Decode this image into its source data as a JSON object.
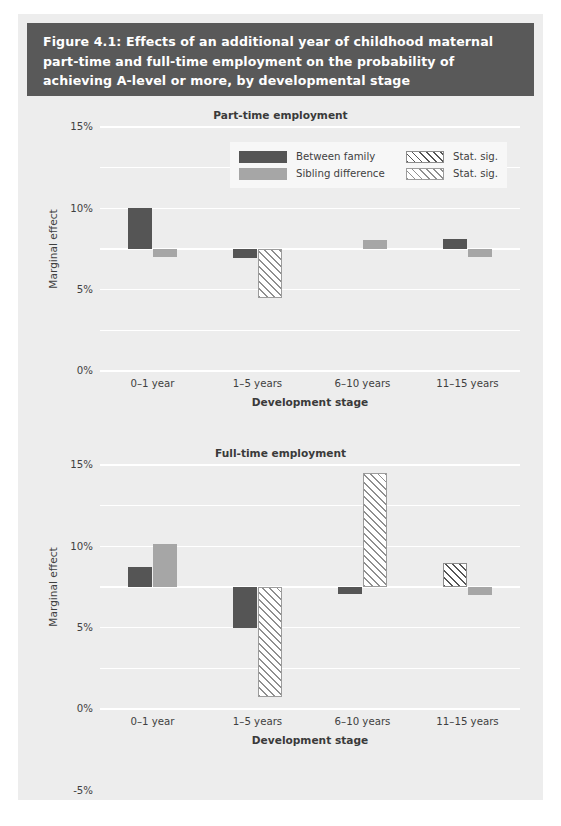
{
  "figure": {
    "title": "Figure 4.1: Effects of an additional year of childhood maternal part-time and full-time employment on the probability of achieving A-level or more, by developmental stage"
  },
  "legend": {
    "position": "top-center",
    "entries": [
      {
        "label": "Between family",
        "swatch": "solid-dark-swatch"
      },
      {
        "label": "Stat. sig.",
        "swatch": "hatch-dark-swatch"
      },
      {
        "label": "Sibling difference",
        "swatch": "solid-light-swatch"
      },
      {
        "label": "Stat. sig.",
        "swatch": "hatch-light-swatch"
      }
    ]
  },
  "colors": {
    "header_background": "#595959",
    "header_text": "#ffffff",
    "panel_background": "#ededed",
    "gridline": "#ffffff",
    "between_family": "#555555",
    "sibling_difference": "#a6a6a6",
    "legend_background": "#f7f7f7"
  },
  "axis": {
    "ylabel": "Marginal effect",
    "xlabel": "Development stage",
    "yticks": [
      "15%",
      "10%",
      "5%",
      "0%",
      "-5%",
      "-10%",
      "-15%"
    ],
    "ytick_values": [
      15,
      10,
      5,
      0,
      -5,
      -10,
      -15
    ],
    "ylim": [
      -15,
      15
    ],
    "categories": [
      "0–1 year",
      "1–5 years",
      "6–10 years",
      "11–15 years"
    ]
  },
  "chart_data": [
    {
      "type": "bar",
      "title": "Part-time employment",
      "xlabel": "Development stage",
      "ylabel": "Marginal effect",
      "ylim": [
        -15,
        15
      ],
      "yticks": [
        15,
        10,
        5,
        0,
        -5,
        -10,
        -15
      ],
      "ytick_labels": [
        "15%",
        "10%",
        "5%",
        "0%",
        "-5%",
        "-10%",
        "-15%"
      ],
      "grid": true,
      "categories": [
        "0–1 year",
        "1–5 years",
        "6–10 years",
        "11–15 years"
      ],
      "series": [
        {
          "name": "Between family",
          "style": "solid-dark",
          "values": [
            5.0,
            -1.1,
            null,
            1.2
          ],
          "stat_sig": [
            false,
            false,
            null,
            false
          ]
        },
        {
          "name": "Sibling difference",
          "style": "solid-light",
          "values": [
            -1.0,
            -6.0,
            1.1,
            -1.0
          ],
          "stat_sig": [
            false,
            true,
            false,
            false
          ]
        }
      ]
    },
    {
      "type": "bar",
      "title": "Full-time employment",
      "xlabel": "Development stage",
      "ylabel": "Marginal effect",
      "ylim": [
        -15,
        15
      ],
      "yticks": [
        15,
        10,
        5,
        0,
        -5,
        -10,
        -15
      ],
      "ytick_labels": [
        "15%",
        "10%",
        "5%",
        "0%",
        "-5%",
        "-10%",
        "-15%"
      ],
      "grid": true,
      "categories": [
        "0–1 year",
        "1–5 years",
        "6–10 years",
        "11–15 years"
      ],
      "series": [
        {
          "name": "Between family",
          "style": "solid-dark",
          "values": [
            2.5,
            -5.0,
            -0.8,
            3.0
          ],
          "stat_sig": [
            false,
            false,
            false,
            true
          ]
        },
        {
          "name": "Sibling difference",
          "style": "solid-light",
          "values": [
            5.3,
            -13.5,
            14.0,
            -1.0
          ],
          "stat_sig": [
            false,
            true,
            true,
            false
          ]
        }
      ]
    }
  ]
}
